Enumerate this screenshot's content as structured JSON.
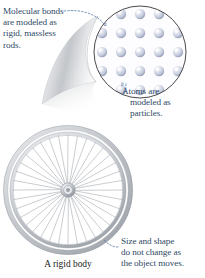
{
  "figure": {
    "caption": "A rigid body",
    "background_color": "#ffffff",
    "annotation_text_color": "#2f4a66",
    "caption_text_color": "#1d1d1d"
  },
  "annotations": {
    "bonds": {
      "label": "Molecular bonds are modeled as rigid, massless rods.",
      "lines": [
        "Molecular bonds",
        "are modeled as",
        "rigid, massless",
        "rods."
      ]
    },
    "atoms": {
      "label": "Atoms are modeled as particles.",
      "lines": [
        "Atoms are",
        "modeled as",
        "particles."
      ]
    },
    "size": {
      "label": "Size and shape do not change as the object moves.",
      "lines": [
        "Size and shape",
        "do not change as",
        "the object moves."
      ]
    }
  },
  "inset": {
    "name": "atomic-lattice-magnifier",
    "description": "Magnified circular inset showing a square lattice of atoms joined by bonds",
    "grid_columns": 5,
    "grid_rows": 5,
    "atom_color": "#c9cede",
    "atom_highlight_color": "#ffffff",
    "bond_color": "#b9c4d6",
    "circle_border_color": "#4a4a4a",
    "inset_fill_color": "#fdfdff",
    "atom_marker_label": "a",
    "bond_marker_label": "b"
  },
  "wheel": {
    "name": "bicycle-wheel-rigid-body",
    "spoke_count": 36,
    "rim_color": "#b9bcc0",
    "spoke_color": "#a9adb3",
    "hub_color": "#9aa0a8"
  },
  "leaders": {
    "bonds_leader_color": "#5b7fae",
    "atoms_leader_color": "#5b7fae",
    "size_leader_color": "#5b7fae"
  }
}
